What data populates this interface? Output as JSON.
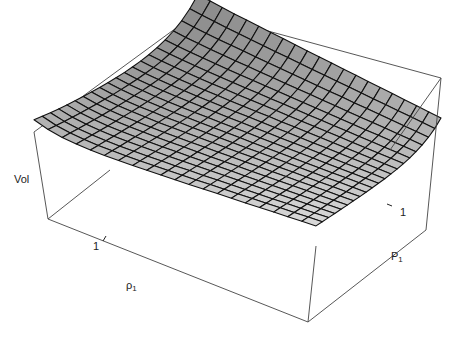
{
  "chart_data": {
    "type": "surface3d",
    "title": "",
    "zlabel": "Vol",
    "xlabel": {
      "symbol": "ρ",
      "subscript": "1"
    },
    "ylabel": {
      "symbol": "P",
      "subscript": "1"
    },
    "x_ticks": [
      "1"
    ],
    "y_ticks": [
      "1"
    ],
    "grid_resolution": [
      20,
      20
    ],
    "surface_color": "#9a9a9a",
    "mesh_color": "#111111",
    "box_color": "#444444"
  },
  "labels": {
    "vol": "Vol",
    "rho_symbol": "ρ",
    "rho_sub": "1",
    "p_symbol": "P",
    "p_sub": "1",
    "rho_tick": "1",
    "p_tick": "1"
  }
}
